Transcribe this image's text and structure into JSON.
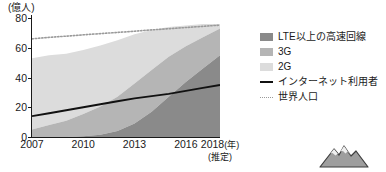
{
  "chart_data": {
    "type": "area",
    "title": "",
    "subtitle": "",
    "unit_caption": "(億人)",
    "xlabel": "(年)",
    "xlabel_note": "(推定)",
    "ylabel": "億人",
    "ylim": [
      0,
      80
    ],
    "xlim": [
      2007,
      2018
    ],
    "yticks": [
      0,
      20,
      40,
      60,
      80
    ],
    "ytick_labels": [
      "0",
      "20",
      "40",
      "60",
      "80"
    ],
    "xticks": [
      2007,
      2010,
      2013,
      2016,
      2018
    ],
    "xtick_labels": [
      "2007",
      "2010",
      "2013",
      "2016",
      "2018"
    ],
    "grid": false,
    "legend_position": "right",
    "x": [
      2007,
      2008,
      2009,
      2010,
      2011,
      2012,
      2013,
      2014,
      2015,
      2016,
      2017,
      2018
    ],
    "stacked_series": [
      {
        "name": "LTE以上の高速回線",
        "color": "#8a8a8a",
        "values": [
          0,
          0,
          0,
          0.5,
          1.5,
          4,
          9,
          17,
          27,
          37,
          46,
          55
        ]
      },
      {
        "name": "3G",
        "color": "#b5b5b5",
        "values": [
          5,
          8,
          11,
          15,
          19,
          23,
          27,
          28,
          27,
          24,
          21,
          18
        ]
      },
      {
        "name": "2G",
        "color": "#dcdcdc",
        "values": [
          48,
          47,
          45,
          43,
          41,
          38,
          33,
          27,
          20,
          14,
          9,
          3
        ]
      }
    ],
    "line_series": [
      {
        "name": "インターネット利用者",
        "style": "solid",
        "color": "#111111",
        "values": [
          14,
          16,
          18,
          20,
          22,
          24,
          26,
          27.5,
          29,
          31,
          33,
          35
        ]
      },
      {
        "name": "世界人口",
        "style": "dotted",
        "color": "#9a9a9a",
        "values": [
          66,
          67,
          67.8,
          68.7,
          69.5,
          70.3,
          71.1,
          72,
          72.8,
          73.6,
          74.4,
          75.2
        ]
      }
    ]
  },
  "legend": {
    "items": [
      {
        "label": "LTE以上の高速回線",
        "type": "swatch",
        "color": "#8a8a8a"
      },
      {
        "label": "3G",
        "type": "swatch",
        "color": "#b5b5b5"
      },
      {
        "label": "2G",
        "type": "swatch",
        "color": "#dcdcdc"
      },
      {
        "label": "インターネット利用者",
        "type": "line",
        "color": "#111111"
      },
      {
        "label": "世界人口",
        "type": "dotted",
        "color": "#9a9a9a"
      }
    ]
  },
  "axis": {
    "unit_caption": "(億人)",
    "y_labels": [
      "80",
      "60",
      "40",
      "20",
      "0"
    ],
    "x_labels": [
      {
        "text": "2007",
        "suffix": "",
        "sub": ""
      },
      {
        "text": "2010",
        "suffix": "",
        "sub": ""
      },
      {
        "text": "2013",
        "suffix": "",
        "sub": ""
      },
      {
        "text": "2016",
        "suffix": "",
        "sub": ""
      },
      {
        "text": "2018",
        "suffix": "(年)",
        "sub": "(推定)"
      }
    ]
  },
  "decoration": {
    "mountain_label": "mountain-illustration"
  }
}
